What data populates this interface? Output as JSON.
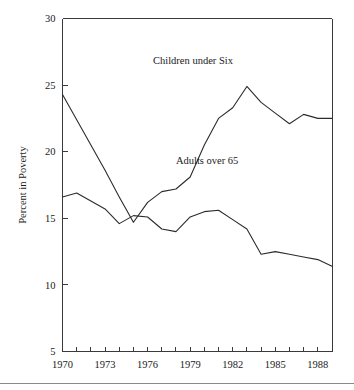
{
  "figure": {
    "name": "poverty-rate-line-chart",
    "background": "#ffffff",
    "ink_color": "#2b2b2b",
    "has_footer_rule": true
  },
  "chart_data": {
    "type": "line",
    "title": "",
    "xlabel": "",
    "ylabel": "Percent in Poverty",
    "xlim": [
      1970,
      1989
    ],
    "ylim": [
      5,
      30
    ],
    "xticks": [
      1970,
      1971,
      1972,
      1973,
      1974,
      1975,
      1976,
      1977,
      1978,
      1979,
      1980,
      1981,
      1982,
      1983,
      1984,
      1985,
      1986,
      1987,
      1988,
      1989
    ],
    "xtick_labels": [
      "1970",
      "",
      "",
      "1973",
      "",
      "",
      "1976",
      "",
      "",
      "1979",
      "",
      "",
      "1982",
      "",
      "",
      "1985",
      "",
      "",
      "1988",
      ""
    ],
    "yticks": [
      5,
      10,
      15,
      20,
      25,
      30
    ],
    "ytick_labels": [
      "5",
      "10",
      "15",
      "20",
      "25",
      "30"
    ],
    "grid": false,
    "legend": "inline-annotations",
    "x": [
      1970,
      1971,
      1972,
      1973,
      1974,
      1975,
      1976,
      1977,
      1978,
      1979,
      1980,
      1981,
      1982,
      1983,
      1984,
      1985,
      1986,
      1987,
      1988,
      1989
    ],
    "series": [
      {
        "name": "Children under Six",
        "label": "Children under Six",
        "label_x": 1979.2,
        "label_y": 26.6,
        "values": [
          24.3,
          22.4,
          20.5,
          18.6,
          16.6,
          14.7,
          16.2,
          17.0,
          17.2,
          18.1,
          20.5,
          22.5,
          23.3,
          24.9,
          23.7,
          22.9,
          22.1,
          22.8,
          22.5,
          22.5
        ]
      },
      {
        "name": "Adults over 65",
        "label": "Adults over 65",
        "label_x": 1980.2,
        "label_y": 19.1,
        "values": [
          16.6,
          16.9,
          16.3,
          15.7,
          14.6,
          15.2,
          15.1,
          14.2,
          14.0,
          15.1,
          15.5,
          15.6,
          14.9,
          14.2,
          12.3,
          12.5,
          12.3,
          12.1,
          11.9,
          11.4
        ]
      }
    ],
    "annotations": [
      {
        "text": "Children under Six",
        "x": 1979.2,
        "y": 26.6
      },
      {
        "text": "Adults over 65",
        "x": 1980.2,
        "y": 19.1
      }
    ]
  }
}
